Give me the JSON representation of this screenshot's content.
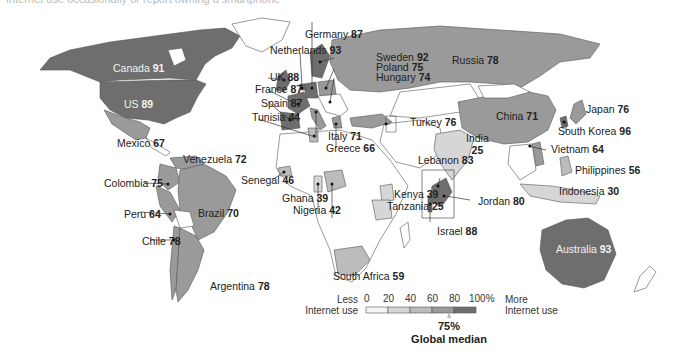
{
  "title": "Internet use occasionally or report owning a smartphone",
  "colors": {
    "bin_0_20": "#f4f4f4",
    "bin_20_40": "#d6d6d6",
    "bin_40_60": "#bcbcbc",
    "bin_60_80": "#9a9a9a",
    "bin_80_100": "#6e6e6e",
    "no_data": "#ffffff",
    "border": "#666666"
  },
  "legend": {
    "less_label": "Less\nInternet use",
    "less_line1": "Less",
    "less_line2": "Internet use",
    "more_line1": "More",
    "more_line2": "Internet use",
    "ticks": [
      "0",
      "20",
      "40",
      "60",
      "80",
      "100%"
    ],
    "median_value": "75%",
    "median_label": "Global median"
  },
  "countries": [
    {
      "name": "Canada",
      "value": 91
    },
    {
      "name": "US",
      "value": 89
    },
    {
      "name": "Mexico",
      "value": 67
    },
    {
      "name": "Venezuela",
      "value": 72
    },
    {
      "name": "Colombia",
      "value": 75
    },
    {
      "name": "Peru",
      "value": 64
    },
    {
      "name": "Brazil",
      "value": 70
    },
    {
      "name": "Chile",
      "value": 78
    },
    {
      "name": "Argentina",
      "value": 78
    },
    {
      "name": "Germany",
      "value": 87
    },
    {
      "name": "Netherlands",
      "value": 93
    },
    {
      "name": "UK",
      "value": 88
    },
    {
      "name": "France",
      "value": 87
    },
    {
      "name": "Spain",
      "value": 87
    },
    {
      "name": "Tunisia",
      "value": 44
    },
    {
      "name": "Italy",
      "value": 71
    },
    {
      "name": "Greece",
      "value": 66
    },
    {
      "name": "Sweden",
      "value": 92
    },
    {
      "name": "Poland",
      "value": 75
    },
    {
      "name": "Hungary",
      "value": 74
    },
    {
      "name": "Russia",
      "value": 78
    },
    {
      "name": "Turkey",
      "value": 76
    },
    {
      "name": "Senegal",
      "value": 46
    },
    {
      "name": "Ghana",
      "value": 39
    },
    {
      "name": "Nigeria",
      "value": 42
    },
    {
      "name": "Kenya",
      "value": 39
    },
    {
      "name": "Tanzania",
      "value": 25
    },
    {
      "name": "South Africa",
      "value": 59
    },
    {
      "name": "Lebanon",
      "value": 83
    },
    {
      "name": "Jordan",
      "value": 80
    },
    {
      "name": "Israel",
      "value": 88
    },
    {
      "name": "India",
      "value": 25
    },
    {
      "name": "China",
      "value": 71
    },
    {
      "name": "Japan",
      "value": 76
    },
    {
      "name": "South Korea",
      "value": 96
    },
    {
      "name": "Vietnam",
      "value": 64
    },
    {
      "name": "Philippines",
      "value": 56
    },
    {
      "name": "Indonesia",
      "value": 30
    },
    {
      "name": "Australia",
      "value": 93
    }
  ]
}
